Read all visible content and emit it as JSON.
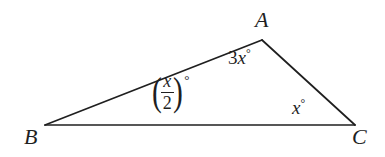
{
  "figure": {
    "type": "geometry-diagram",
    "shape": "triangle",
    "background_color": "#ffffff",
    "stroke_color": "#1f1f1f",
    "stroke_width": 1.6,
    "vertices": [
      {
        "name": "A",
        "label": "A",
        "x": 262,
        "y": 40,
        "label_x": 255,
        "label_y": 9
      },
      {
        "name": "B",
        "label": "B",
        "x": 45,
        "y": 125,
        "label_x": 24,
        "label_y": 126
      },
      {
        "name": "C",
        "label": "C",
        "x": 355,
        "y": 125,
        "label_x": 352,
        "label_y": 126
      }
    ],
    "sides": [
      {
        "name": "BA",
        "from": "B",
        "to": "A"
      },
      {
        "name": "AC",
        "from": "A",
        "to": "C"
      },
      {
        "name": "BC",
        "from": "B",
        "to": "C"
      }
    ],
    "angles": [
      {
        "at_vertex": "A",
        "name": "angle-a",
        "notation": "3x°",
        "coefficient": "3",
        "variable": "x",
        "degree_symbol": "°"
      },
      {
        "at_vertex": "B",
        "name": "angle-b",
        "notation": "(x/2)°",
        "numerator": "x",
        "denominator": "2",
        "left_paren": "(",
        "right_paren": ")",
        "degree_symbol": "°"
      },
      {
        "at_vertex": "C",
        "name": "angle-c",
        "notation": "x°",
        "variable": "x",
        "degree_symbol": "°"
      }
    ]
  }
}
